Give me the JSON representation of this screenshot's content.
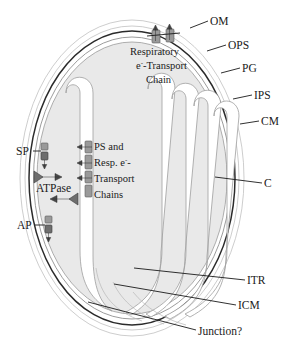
{
  "figure": {
    "fill_colors": {
      "cytoplasm": "#e9e9e9",
      "thylakoid_lumen": "#ffffff",
      "envelope_dark": "#2b2b2b",
      "complex_gray": "#9a9a9a",
      "arrow_dark": "#4a4a4a",
      "text": "#1a1a1a"
    }
  },
  "callouts": {
    "outer_membrane": "OM",
    "outer_periplasmic_space": "OPS",
    "peptidoglycan": "PG",
    "inner_periplasmic_space": "IPS",
    "cytoplasmic_membrane": "CM",
    "cytoplasm": "C",
    "intrathylakoid_region": "ITR",
    "intracytoplasmic_membrane": "ICM",
    "junction": "Junction?"
  },
  "transporters": {
    "solute_porter": "SP",
    "anion_porter": "AP",
    "atpase": "ATPase"
  },
  "annotations": {
    "respiratory_chain": {
      "line1": "Respiratory",
      "line2_prefix": "e",
      "line2_sup": "-",
      "line2_suffix": "-Transport",
      "line3": "Chain"
    },
    "thylakoid_chains": {
      "line1": "PS and",
      "line2_prefix": "Resp. e",
      "line2_sup": "-",
      "line2_suffix": "-",
      "line3": "Transport",
      "line4": "Chains"
    }
  }
}
